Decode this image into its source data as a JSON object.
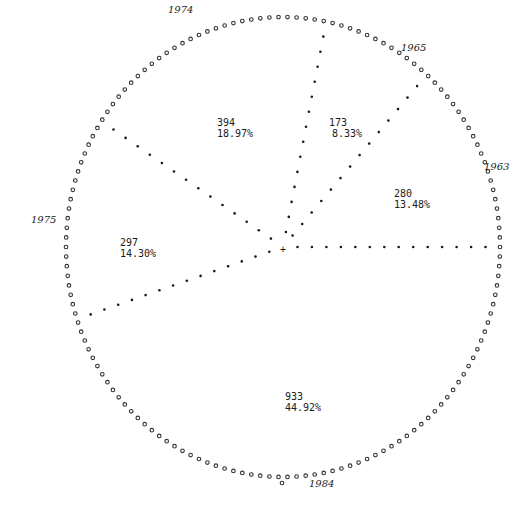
{
  "chart_data": {
    "type": "pie",
    "style": "line-printer dotted pie",
    "title": "",
    "total": 2077,
    "slices": [
      {
        "value": 280,
        "percent": "13.48%",
        "label_value": "280",
        "label_percent": "13.48%"
      },
      {
        "value": 173,
        "percent": "8.33%",
        "label_value": "173",
        "label_percent": "8.33%"
      },
      {
        "value": 394,
        "percent": "18.97%",
        "label_value": "394",
        "label_percent": "18.97%"
      },
      {
        "value": 297,
        "percent": "14.30%",
        "label_value": "297",
        "label_percent": "14.30%"
      },
      {
        "value": 933,
        "percent": "44.92%",
        "label_value": "933",
        "label_percent": "44.92%"
      }
    ],
    "boundary_labels": [
      "1963",
      "1965",
      "1974",
      "1975",
      "1984"
    ],
    "start_angle_deg": 0,
    "direction": "counter-clockwise"
  },
  "labels": {
    "s280": {
      "value": "280",
      "percent": "13.48%"
    },
    "s173": {
      "value": "173",
      "percent": "8.33%"
    },
    "s394": {
      "value": "394",
      "percent": "18.97%"
    },
    "s297": {
      "value": "297",
      "percent": "14.30%"
    },
    "s933": {
      "value": "933",
      "percent": "44.92%"
    },
    "years": {
      "y1963": "1963",
      "y1965": "1965",
      "y1974": "1974",
      "y1975": "1975",
      "y1984": "1984"
    },
    "center_mark": "+"
  }
}
